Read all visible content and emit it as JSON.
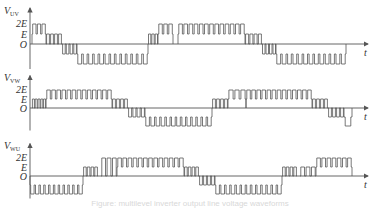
{
  "diagram": {
    "type": "multilevel PWM line-voltage waveforms",
    "panels": [
      {
        "id": "uv",
        "ylabel": "V",
        "ylabel_sub": "UV",
        "ticks": [
          "2E",
          "E",
          "O"
        ],
        "xlabel": "t",
        "baseline_y": 44,
        "level_px": 10,
        "segments": [
          {
            "level": 2,
            "x0": 32,
            "x1": 46,
            "pulses": 3,
            "base": 1
          },
          {
            "level": 1,
            "x0": 46,
            "x1": 62,
            "pulses": 4,
            "base": 0
          },
          {
            "level": -1,
            "x0": 62,
            "x1": 77,
            "pulses": 4,
            "base": 0
          },
          {
            "level": -2,
            "x0": 77,
            "x1": 148,
            "pulses": 13,
            "base": -1
          },
          {
            "level": 1,
            "x0": 148,
            "x1": 158,
            "pulses": 3,
            "base": 0
          },
          {
            "level": 2,
            "x0": 158,
            "x1": 173,
            "pulses": 3,
            "base": 1
          },
          {
            "level": 2,
            "x0": 178,
            "x1": 245,
            "pulses": 13,
            "base": 1
          },
          {
            "level": 1,
            "x0": 245,
            "x1": 262,
            "pulses": 4,
            "base": 0
          },
          {
            "level": -1,
            "x0": 262,
            "x1": 276,
            "pulses": 4,
            "base": 0
          },
          {
            "level": -2,
            "x0": 276,
            "x1": 346,
            "pulses": 13,
            "base": -1
          }
        ]
      },
      {
        "id": "vw",
        "ylabel": "V",
        "ylabel_sub": "VW",
        "ticks": [
          "2E",
          "E",
          "O"
        ],
        "xlabel": "t",
        "baseline_y": 108,
        "level_px": 9,
        "segments": [
          {
            "level": 1,
            "x0": 32,
            "x1": 46,
            "pulses": 5,
            "base": 0
          },
          {
            "level": 2,
            "x0": 46,
            "x1": 112,
            "pulses": 13,
            "base": 1
          },
          {
            "level": 1,
            "x0": 112,
            "x1": 128,
            "pulses": 4,
            "base": 0
          },
          {
            "level": -1,
            "x0": 128,
            "x1": 145,
            "pulses": 4,
            "base": 0
          },
          {
            "level": -2,
            "x0": 145,
            "x1": 212,
            "pulses": 13,
            "base": -1
          },
          {
            "level": 1,
            "x0": 212,
            "x1": 228,
            "pulses": 4,
            "base": 0
          },
          {
            "level": 2,
            "x0": 228,
            "x1": 246,
            "pulses": 3,
            "base": 1
          },
          {
            "level": 2,
            "x0": 246,
            "x1": 312,
            "pulses": 13,
            "base": 1
          },
          {
            "level": 1,
            "x0": 312,
            "x1": 328,
            "pulses": 4,
            "base": 0
          },
          {
            "level": -1,
            "x0": 328,
            "x1": 344,
            "pulses": 4,
            "base": 0
          },
          {
            "level": -2,
            "x0": 344,
            "x1": 352,
            "pulses": 1,
            "base": -1
          }
        ]
      },
      {
        "id": "wu",
        "ylabel": "V",
        "ylabel_sub": "WU",
        "ticks": [
          "2E",
          "E",
          "O"
        ],
        "xlabel": "t",
        "baseline_y": 176,
        "level_px": 9,
        "segments": [
          {
            "level": -2,
            "x0": 30,
            "x1": 83,
            "pulses": 11,
            "base": -1
          },
          {
            "level": 1,
            "x0": 83,
            "x1": 98,
            "pulses": 4,
            "base": 0
          },
          {
            "level": 2,
            "x0": 101,
            "x1": 117,
            "pulses": 3,
            "base": 0
          },
          {
            "level": 2,
            "x0": 117,
            "x1": 184,
            "pulses": 13,
            "base": 1
          },
          {
            "level": 1,
            "x0": 184,
            "x1": 199,
            "pulses": 4,
            "base": 0
          },
          {
            "level": -1,
            "x0": 199,
            "x1": 215,
            "pulses": 4,
            "base": 0
          },
          {
            "level": -2,
            "x0": 215,
            "x1": 282,
            "pulses": 13,
            "base": -1
          },
          {
            "level": 1,
            "x0": 282,
            "x1": 297,
            "pulses": 4,
            "base": 0
          },
          {
            "level": 1,
            "x0": 300,
            "x1": 316,
            "pulses": 3,
            "base": 0
          },
          {
            "level": 2,
            "x0": 316,
            "x1": 352,
            "pulses": 7,
            "base": 1
          }
        ]
      }
    ],
    "caption": "Figure: multilevel inverter output line voltage waveforms"
  }
}
